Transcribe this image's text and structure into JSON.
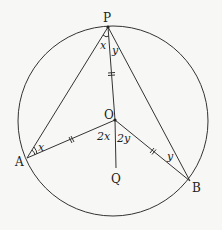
{
  "diagram": {
    "type": "circle-geometry",
    "circle": {
      "cx": 113,
      "cy": 121,
      "r": 95
    },
    "points": {
      "P": {
        "label": "P",
        "x": 108,
        "y": 27
      },
      "O": {
        "label": "O",
        "x": 115,
        "y": 120
      },
      "A": {
        "label": "A",
        "x": 27,
        "y": 158
      },
      "B": {
        "label": "B",
        "x": 190,
        "y": 181
      },
      "Q": {
        "label": "Q",
        "x": 116,
        "y": 168
      }
    },
    "angle_labels": {
      "x_at_P": "x",
      "y_at_P": "y",
      "x_at_A": "x",
      "y_at_B": "y",
      "two_x_at_O": "2x",
      "two_y_at_O": "2y"
    },
    "segments": [
      "PA",
      "PB",
      "PO",
      "OA",
      "OB",
      "OQ"
    ],
    "equal_marks": [
      "PO",
      "OA",
      "OB"
    ],
    "colors": {
      "line": "#333333",
      "background": "#f7f7f5"
    }
  }
}
